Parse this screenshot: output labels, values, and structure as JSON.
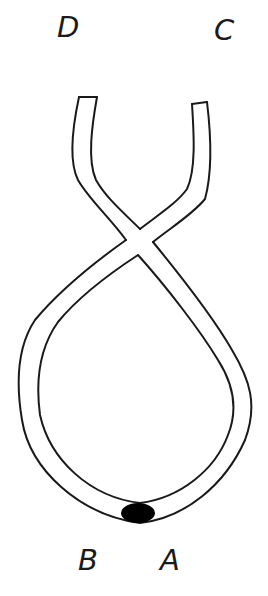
{
  "diagram": {
    "labels": {
      "top_left": "D",
      "top_right": "C",
      "bottom_left": "B",
      "bottom_right": "A"
    },
    "colors": {
      "stroke": "#1a1a1a",
      "blob": "#000000",
      "background": "#ffffff"
    }
  }
}
